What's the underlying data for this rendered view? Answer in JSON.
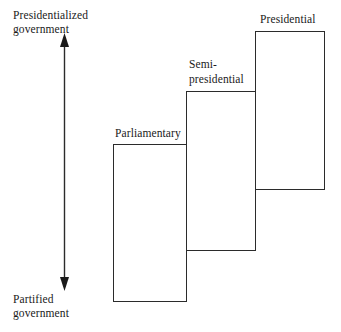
{
  "figure": {
    "type": "conceptual-diagram",
    "background_color": "#ffffff",
    "line_color": "#2b2b2b",
    "text_color": "#1a1a1a"
  },
  "axis": {
    "orientation": "vertical",
    "arrow_style": "double-headed",
    "top_label": "Presidentialized\ngovernment",
    "bottom_label": "Partified\ngovernment"
  },
  "boxes": [
    {
      "id": "parliamentary",
      "label": "Parliamentary",
      "rank": 1
    },
    {
      "id": "semi-presidential",
      "label": "Semi-\npresidential",
      "rank": 2
    },
    {
      "id": "presidential",
      "label": "Presidential",
      "rank": 3
    }
  ]
}
